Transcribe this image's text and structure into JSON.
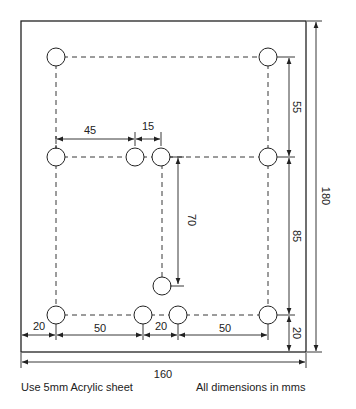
{
  "drawing": {
    "sheet": {
      "width_mm": 160,
      "height_mm": 180
    },
    "dimensions": {
      "overall_width": "160",
      "overall_height": "180",
      "top_gap_right": "55",
      "mid_gap_right": "85",
      "bottom_gap_right": "20",
      "left_to_mid": "45",
      "mid_spacing": "15",
      "vertical_70": "70",
      "bottom_left_edge": "20",
      "bottom_50_left": "50",
      "bottom_20_mid": "20",
      "bottom_50_right": "50"
    },
    "notes": {
      "material": "Use 5mm Acrylic sheet",
      "units": "All dimensions in mms"
    },
    "colors": {
      "line": "#222222",
      "background": "#ffffff"
    }
  }
}
